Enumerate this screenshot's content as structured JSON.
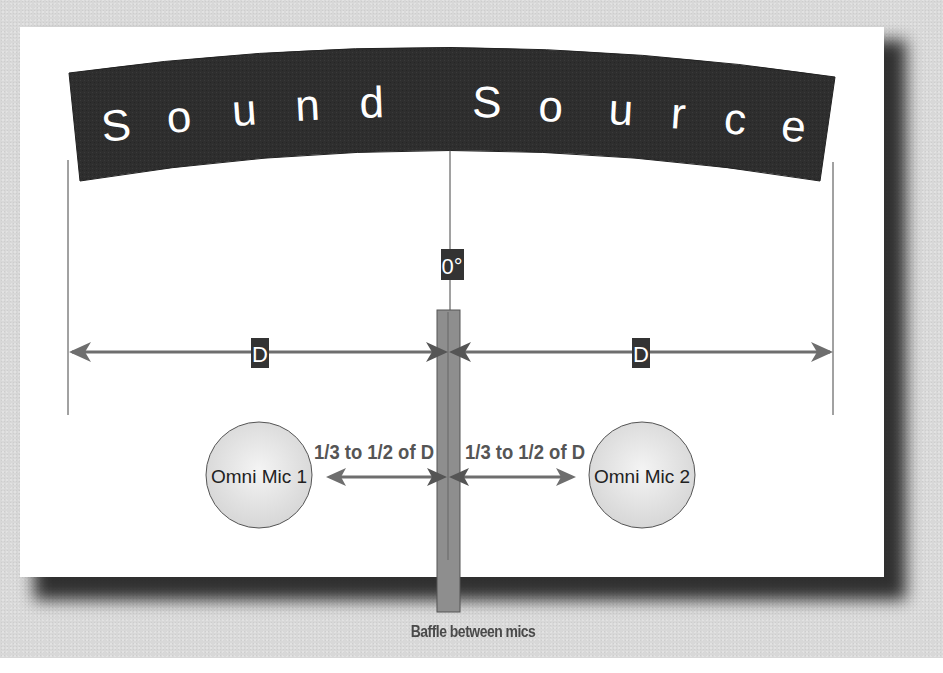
{
  "diagram": {
    "title_letters": [
      "S",
      "o",
      "u",
      "n",
      "d",
      "S",
      "o",
      "u",
      "r",
      "c",
      "e"
    ],
    "angle_label": "0°",
    "distance_label": "D",
    "mic_spacing_label_left": "1/3 to 1/2 of D",
    "mic_spacing_label_right": "1/3 to 1/2 of D",
    "mic_left": "Omni Mic 1",
    "mic_right": "Omni Mic 2",
    "baffle_caption": "Baffle between mics"
  },
  "colors": {
    "background": "#d8d8d8",
    "panel": "#ffffff",
    "banner": "#2e2e2e",
    "arrow": "#6e6e6e",
    "label_box": "#333333",
    "baffle": "#8c8c8c",
    "mic_fill": "#e6e6e6",
    "caption_text": "#4a4a4a"
  }
}
